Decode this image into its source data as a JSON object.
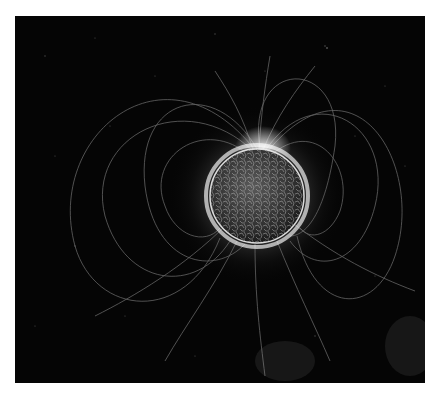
{
  "image": {
    "description": "Visualization of a star with magnetic field lines radiating from its surface against a dark starry background",
    "subject": "magnetic-field-star",
    "colors": {
      "background": "#050505",
      "border": "#ffffff",
      "glow": "#ffffff",
      "surface": "#3a3a3a"
    }
  }
}
